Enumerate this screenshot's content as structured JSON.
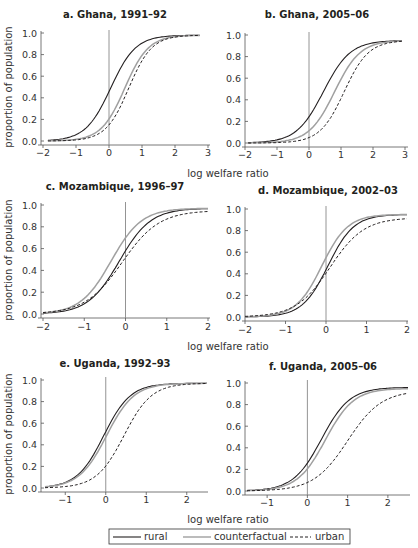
{
  "figure": {
    "xlabel": "log welfare ratio",
    "ylabel": "proportion of population",
    "legend": [
      {
        "label": "rural",
        "style": "solid",
        "color": "#231f20"
      },
      {
        "label": "counterfactual",
        "style": "solid",
        "color": "#a0a0a0"
      },
      {
        "label": "urban",
        "style": "dashed",
        "color": "#231f20"
      }
    ]
  },
  "chart_data": [
    {
      "type": "line",
      "title": "a. Ghana, 1991–92",
      "xlabel": "",
      "ylabel": "proportion of population",
      "xlim": [
        -2,
        3
      ],
      "ylim": [
        0,
        1
      ],
      "xticks": [
        -2,
        -1,
        0,
        1,
        2,
        3
      ],
      "yticks": [
        "0.0",
        "0.2",
        "0.4",
        "0.6",
        "0.8",
        "1.0"
      ],
      "vline_x": 0,
      "series": [
        {
          "name": "rural",
          "x": [
            -1.85,
            -1,
            -0.5,
            0,
            0.5,
            1,
            1.5,
            2,
            2.75
          ],
          "values": [
            0.0,
            0.06,
            0.2,
            0.48,
            0.78,
            0.93,
            0.97,
            0.98,
            0.98
          ],
          "center": 0.05,
          "scale": 0.38
        },
        {
          "name": "counterfactual",
          "x": [
            -1.85,
            -1,
            -0.5,
            0,
            0.5,
            1,
            1.5,
            2,
            2.75
          ],
          "values": [
            0.0,
            0.02,
            0.07,
            0.22,
            0.52,
            0.8,
            0.93,
            0.97,
            0.98
          ],
          "center": 0.48,
          "scale": 0.36
        },
        {
          "name": "urban",
          "x": [
            -1.85,
            -1,
            -0.5,
            0,
            0.5,
            1,
            1.5,
            2,
            2.75
          ],
          "values": [
            0.0,
            0.01,
            0.05,
            0.16,
            0.43,
            0.75,
            0.92,
            0.97,
            0.98
          ],
          "center": 0.6,
          "scale": 0.35
        }
      ]
    },
    {
      "type": "line",
      "title": "b. Ghana, 2005–06",
      "xlabel": "",
      "ylabel": "",
      "xlim": [
        -2,
        3
      ],
      "ylim": [
        0,
        1
      ],
      "xticks": [
        -2,
        -1,
        0,
        1,
        2,
        3
      ],
      "yticks": [
        "0.0",
        "0.2",
        "0.4",
        "0.6",
        "0.8",
        "1.0"
      ],
      "vline_x": 0,
      "series": [
        {
          "name": "rural",
          "x": [
            -1.9,
            -1,
            -0.5,
            0,
            0.5,
            1,
            1.5,
            2,
            2.9
          ],
          "values": [
            0.01,
            0.04,
            0.12,
            0.28,
            0.55,
            0.8,
            0.92,
            0.95,
            0.95
          ],
          "center": 0.45,
          "scale": 0.42
        },
        {
          "name": "counterfactual",
          "x": [
            -1.9,
            -1,
            -0.5,
            0,
            0.5,
            1,
            1.5,
            2,
            2.9
          ],
          "values": [
            0.0,
            0.02,
            0.06,
            0.15,
            0.37,
            0.65,
            0.85,
            0.93,
            0.95
          ],
          "center": 0.8,
          "scale": 0.4
        },
        {
          "name": "urban",
          "x": [
            -1.9,
            -1,
            -0.5,
            0,
            0.5,
            1,
            1.5,
            2,
            2.9
          ],
          "values": [
            0.0,
            0.01,
            0.03,
            0.07,
            0.2,
            0.45,
            0.72,
            0.88,
            0.95
          ],
          "center": 1.1,
          "scale": 0.38
        }
      ]
    },
    {
      "type": "line",
      "title": "c. Mozambique, 1996–97",
      "xlabel": "",
      "ylabel": "proportion of population",
      "xlim": [
        -2,
        2
      ],
      "ylim": [
        0,
        1
      ],
      "xticks": [
        -2,
        -1,
        0,
        1,
        2
      ],
      "yticks": [
        "0.0",
        "0.2",
        "0.4",
        "0.6",
        "0.8",
        "1.0"
      ],
      "vline_x": 0,
      "series": [
        {
          "name": "rural",
          "x": [
            -2,
            -1.5,
            -1,
            -0.5,
            0,
            0.5,
            1,
            1.5,
            2
          ],
          "values": [
            0.0,
            0.04,
            0.12,
            0.32,
            0.6,
            0.83,
            0.93,
            0.97,
            0.97
          ],
          "center": -0.15,
          "scale": 0.38
        },
        {
          "name": "counterfactual",
          "x": [
            -2,
            -1.5,
            -1,
            -0.5,
            0,
            0.5,
            1,
            1.5,
            2
          ],
          "values": [
            0.0,
            0.05,
            0.17,
            0.43,
            0.71,
            0.88,
            0.94,
            0.97,
            0.97
          ],
          "center": -0.35,
          "scale": 0.37
        },
        {
          "name": "urban",
          "x": [
            -2,
            -1.5,
            -1,
            -0.5,
            0,
            0.5,
            1,
            1.5,
            2
          ],
          "values": [
            0.0,
            0.04,
            0.12,
            0.3,
            0.55,
            0.75,
            0.88,
            0.93,
            0.95
          ],
          "center": -0.08,
          "scale": 0.45
        }
      ]
    },
    {
      "type": "line",
      "title": "d. Mozambique, 2002–03",
      "xlabel": "",
      "ylabel": "",
      "xlim": [
        -2,
        2
      ],
      "ylim": [
        0,
        1
      ],
      "xticks": [
        -2,
        -1,
        0,
        1,
        2
      ],
      "yticks": [
        "0.0",
        "0.2",
        "0.4",
        "0.6",
        "0.8",
        "1.0"
      ],
      "vline_x": 0,
      "series": [
        {
          "name": "rural",
          "x": [
            -2,
            -1.5,
            -1,
            -0.5,
            0,
            0.5,
            1,
            1.5,
            2
          ],
          "values": [
            0.0,
            0.01,
            0.05,
            0.2,
            0.45,
            0.75,
            0.9,
            0.94,
            0.95
          ],
          "center": 0.05,
          "scale": 0.32
        },
        {
          "name": "counterfactual",
          "x": [
            -2,
            -1.5,
            -1,
            -0.5,
            0,
            0.5,
            1,
            1.5,
            2
          ],
          "values": [
            0.0,
            0.01,
            0.06,
            0.25,
            0.56,
            0.82,
            0.92,
            0.95,
            0.95
          ],
          "center": -0.1,
          "scale": 0.32
        },
        {
          "name": "urban",
          "x": [
            -2,
            -1.5,
            -1,
            -0.5,
            0,
            0.5,
            1,
            1.5,
            2
          ],
          "values": [
            0.0,
            0.01,
            0.05,
            0.2,
            0.44,
            0.67,
            0.82,
            0.89,
            0.92
          ],
          "center": 0.1,
          "scale": 0.42
        }
      ]
    },
    {
      "type": "line",
      "title": "e. Uganda, 1992–93",
      "xlabel": "log welfare ratio",
      "ylabel": "proportion of population",
      "xlim": [
        -1.5,
        2.5
      ],
      "ylim": [
        0,
        1
      ],
      "xticks": [
        -1,
        0,
        1,
        2
      ],
      "yticks": [
        "0.0",
        "0.2",
        "0.4",
        "0.6",
        "0.8",
        "1.0"
      ],
      "vline_x": 0,
      "series": [
        {
          "name": "rural",
          "x": [
            -1.5,
            -1,
            -0.5,
            0,
            0.5,
            1,
            1.5,
            2,
            2.5
          ],
          "values": [
            0.0,
            0.06,
            0.22,
            0.53,
            0.8,
            0.93,
            0.96,
            0.97,
            0.97
          ],
          "center": -0.05,
          "scale": 0.33
        },
        {
          "name": "counterfactual",
          "x": [
            -1.5,
            -1,
            -0.5,
            0,
            0.5,
            1,
            1.5,
            2,
            2.5
          ],
          "values": [
            0.0,
            0.05,
            0.19,
            0.48,
            0.77,
            0.91,
            0.96,
            0.97,
            0.97
          ],
          "center": 0.02,
          "scale": 0.34
        },
        {
          "name": "urban",
          "x": [
            -1.5,
            -1,
            -0.5,
            0,
            0.5,
            1,
            1.5,
            2,
            2.5
          ],
          "values": [
            0.0,
            0.02,
            0.07,
            0.24,
            0.52,
            0.8,
            0.93,
            0.96,
            0.97
          ],
          "center": 0.45,
          "scale": 0.34
        }
      ]
    },
    {
      "type": "line",
      "title": "f. Uganda, 2005–06",
      "xlabel": "log welfare ratio",
      "ylabel": "",
      "xlim": [
        -1.5,
        2.5
      ],
      "ylim": [
        0,
        1
      ],
      "xticks": [
        -1,
        0,
        1,
        2
      ],
      "yticks": [
        "0.0",
        "0.2",
        "0.4",
        "0.6",
        "0.8",
        "1.0"
      ],
      "vline_x": 0,
      "series": [
        {
          "name": "rural",
          "x": [
            -1.5,
            -1,
            -0.5,
            0,
            0.5,
            1,
            1.5,
            2,
            2.5
          ],
          "values": [
            0.0,
            0.02,
            0.08,
            0.28,
            0.6,
            0.83,
            0.92,
            0.95,
            0.96
          ],
          "center": 0.35,
          "scale": 0.35
        },
        {
          "name": "counterfactual",
          "x": [
            -1.5,
            -1,
            -0.5,
            0,
            0.5,
            1,
            1.5,
            2,
            2.5
          ],
          "values": [
            0.0,
            0.01,
            0.06,
            0.22,
            0.54,
            0.79,
            0.9,
            0.94,
            0.95
          ],
          "center": 0.45,
          "scale": 0.35
        },
        {
          "name": "urban",
          "x": [
            -1.5,
            -1,
            -0.5,
            0,
            0.5,
            1,
            1.5,
            2,
            2.5
          ],
          "values": [
            0.0,
            0.0,
            0.02,
            0.08,
            0.23,
            0.5,
            0.74,
            0.88,
            0.93
          ],
          "center": 1.0,
          "scale": 0.42
        }
      ]
    }
  ],
  "panels_layout": [
    {
      "x0": 41,
      "y_top": 33,
      "y_bottom": 141,
      "px_x_min": 43,
      "px_x_max": 208,
      "title_x": 115,
      "title_y": 18,
      "tick_y": 156,
      "axis_right": 210
    },
    {
      "x0": 245,
      "y_top": 35,
      "y_bottom": 143,
      "px_x_min": 245,
      "px_x_max": 405,
      "title_x": 317,
      "title_y": 18,
      "tick_y": 158,
      "axis_right": 408
    },
    {
      "x0": 41,
      "y_top": 205,
      "y_bottom": 314,
      "px_x_min": 43,
      "px_x_max": 208,
      "title_x": 115,
      "title_y": 190,
      "tick_y": 330,
      "axis_right": 210
    },
    {
      "x0": 245,
      "y_top": 209,
      "y_bottom": 317,
      "px_x_min": 245,
      "px_x_max": 407,
      "title_x": 328,
      "title_y": 194,
      "tick_y": 333,
      "axis_right": 408
    },
    {
      "x0": 41,
      "y_top": 380,
      "y_bottom": 488,
      "px_x_min": 45,
      "px_x_max": 207,
      "title_x": 115,
      "title_y": 367,
      "tick_y": 503,
      "axis_right": 208
    },
    {
      "x0": 245,
      "y_top": 383,
      "y_bottom": 491,
      "px_x_min": 247,
      "px_x_max": 408,
      "title_x": 323,
      "title_y": 370,
      "tick_y": 506,
      "axis_right": 410
    }
  ]
}
